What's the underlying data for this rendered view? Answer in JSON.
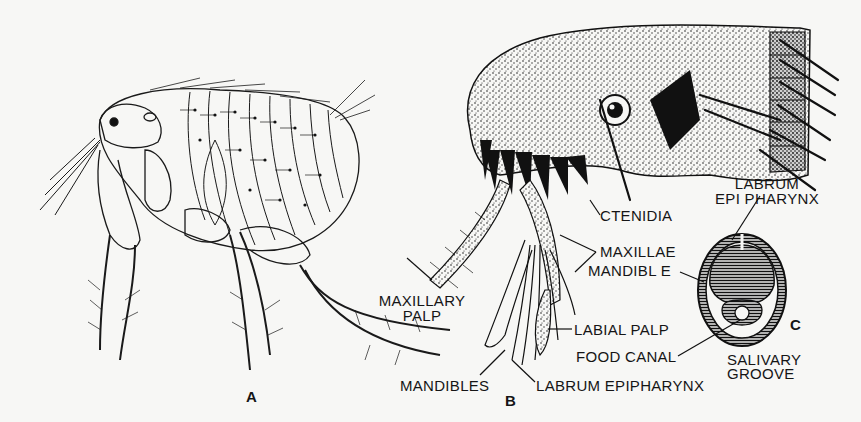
{
  "figure": {
    "title": "",
    "background": "#f7f7f5",
    "ink": "#151515",
    "panels": [
      {
        "id": "A",
        "letter": "A",
        "description": "Adult flea, lateral view"
      },
      {
        "id": "B",
        "letter": "B",
        "description": "Head and mouthparts of flea"
      },
      {
        "id": "C",
        "letter": "C",
        "description": "Cross-section of mouthparts"
      }
    ]
  },
  "labels": {
    "ctenidia": "CTENIDIA",
    "maxillae": "MAXILLAE",
    "maxillary_palp_line1": "MAXILLARY",
    "maxillary_palp_line2": "PALP",
    "labial_palp": "LABIAL PALP",
    "mandibles": "MANDIBLES",
    "labrum_epipharynx_b": "LABRUM EPIPHARYNX",
    "labrum_epipharynx_c_line1": "LABRUM",
    "labrum_epipharynx_c_line2": "EPI PHARYNX",
    "mandible": "MANDIBL E",
    "food_canal": "FOOD CANAL",
    "salivary_groove_line1": "SALIVARY",
    "salivary_groove_line2": "GROOVE"
  }
}
